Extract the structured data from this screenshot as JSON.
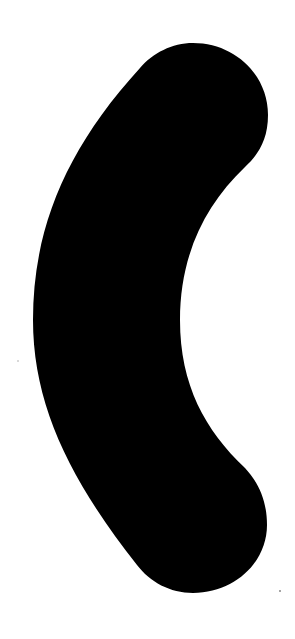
{
  "image": {
    "description": "Black crescent / curved bracket shape on white background",
    "shape": "crescent",
    "colors": {
      "background": "#ffffff",
      "shape_fill": "#000000"
    }
  }
}
